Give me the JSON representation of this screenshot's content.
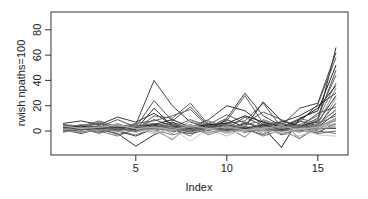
{
  "chart_data": {
    "type": "line",
    "title": "",
    "xlabel": "Index",
    "ylabel": "rwish npaths=100",
    "xlim": [
      0.3,
      16.7
    ],
    "ylim": [
      -18,
      95
    ],
    "xticks": [
      5,
      10,
      15
    ],
    "yticks": [
      0,
      20,
      40,
      60,
      80
    ],
    "grid": false,
    "legend": "none",
    "x": [
      1,
      2,
      3,
      4,
      5,
      6,
      7,
      8,
      9,
      10,
      11,
      12,
      13,
      14,
      15,
      16
    ],
    "series": [
      {
        "name": "path-1",
        "color": "#333333",
        "values": [
          3,
          2,
          1,
          -2,
          -12,
          -3,
          3,
          1,
          2,
          4,
          2,
          5,
          -3,
          2,
          8,
          66
        ]
      },
      {
        "name": "path-2",
        "color": "#444444",
        "values": [
          4,
          3,
          6,
          2,
          5,
          40,
          20,
          7,
          3,
          10,
          30,
          12,
          4,
          18,
          22,
          62
        ]
      },
      {
        "name": "path-3",
        "color": "#555555",
        "values": [
          2,
          5,
          3,
          9,
          3,
          24,
          8,
          19,
          4,
          6,
          8,
          22,
          3,
          7,
          21,
          58
        ]
      },
      {
        "name": "path-4",
        "color": "#222222",
        "values": [
          1,
          0,
          3,
          1,
          2,
          4,
          3,
          2,
          4,
          1,
          6,
          3,
          -13,
          10,
          16,
          52
        ]
      },
      {
        "name": "path-5",
        "color": "#666666",
        "values": [
          5,
          4,
          8,
          3,
          6,
          8,
          12,
          17,
          3,
          8,
          28,
          6,
          2,
          5,
          12,
          44
        ]
      },
      {
        "name": "path-6",
        "color": "#777777",
        "values": [
          0,
          2,
          -2,
          4,
          1,
          6,
          2,
          -4,
          8,
          3,
          -5,
          9,
          4,
          2,
          9,
          38
        ]
      },
      {
        "name": "path-7",
        "color": "#888888",
        "values": [
          3,
          1,
          2,
          0,
          -3,
          2,
          -7,
          5,
          0,
          6,
          2,
          1,
          8,
          -6,
          5,
          34
        ]
      },
      {
        "name": "path-8",
        "color": "#3a3a3a",
        "values": [
          6,
          8,
          5,
          11,
          7,
          14,
          5,
          3,
          9,
          20,
          16,
          5,
          7,
          12,
          20,
          30
        ]
      },
      {
        "name": "path-9",
        "color": "#999999",
        "values": [
          2,
          -1,
          4,
          2,
          0,
          5,
          -2,
          8,
          3,
          -1,
          4,
          -2,
          6,
          3,
          2,
          26
        ]
      },
      {
        "name": "path-10",
        "color": "#4a4a4a",
        "values": [
          1,
          3,
          0,
          5,
          2,
          9,
          4,
          1,
          6,
          2,
          11,
          4,
          1,
          8,
          4,
          22
        ]
      },
      {
        "name": "path-11",
        "color": "#5a5a5a",
        "values": [
          4,
          2,
          3,
          -3,
          1,
          12,
          10,
          22,
          5,
          13,
          6,
          15,
          9,
          3,
          14,
          19
        ]
      },
      {
        "name": "path-12",
        "color": "#aaaaaa",
        "values": [
          0,
          1,
          -1,
          2,
          3,
          -1,
          1,
          3,
          -2,
          5,
          0,
          3,
          2,
          -1,
          6,
          16
        ]
      },
      {
        "name": "path-13",
        "color": "#2a2a2a",
        "values": [
          2,
          0,
          1,
          3,
          0,
          4,
          7,
          2,
          1,
          9,
          3,
          23,
          8,
          4,
          3,
          14
        ]
      },
      {
        "name": "path-14",
        "color": "#6a6a6a",
        "values": [
          5,
          3,
          7,
          2,
          4,
          6,
          3,
          9,
          4,
          2,
          5,
          8,
          3,
          10,
          6,
          12
        ]
      },
      {
        "name": "path-15",
        "color": "#7a7a7a",
        "values": [
          -1,
          2,
          0,
          -4,
          2,
          1,
          -3,
          0,
          3,
          -2,
          2,
          -4,
          1,
          -6,
          3,
          10
        ]
      },
      {
        "name": "path-16",
        "color": "#8a8a8a",
        "values": [
          3,
          4,
          2,
          6,
          1,
          3,
          5,
          2,
          7,
          4,
          1,
          6,
          5,
          2,
          4,
          8
        ]
      },
      {
        "name": "path-17",
        "color": "#3f3f3f",
        "values": [
          1,
          -2,
          2,
          0,
          -4,
          2,
          0,
          -2,
          1,
          3,
          -1,
          2,
          0,
          1,
          -1,
          6
        ]
      },
      {
        "name": "path-18",
        "color": "#bbbbbb",
        "values": [
          2,
          1,
          3,
          1,
          2,
          0,
          -6,
          3,
          1,
          -4,
          2,
          0,
          -2,
          -4,
          1,
          4
        ]
      },
      {
        "name": "path-19",
        "color": "#4f4f4f",
        "values": [
          0,
          2,
          1,
          3,
          0,
          2,
          1,
          0,
          2,
          1,
          3,
          2,
          1,
          0,
          2,
          2
        ]
      },
      {
        "name": "path-20",
        "color": "#606060",
        "values": [
          4,
          1,
          -1,
          2,
          5,
          1,
          3,
          -1,
          4,
          0,
          2,
          -3,
          4,
          1,
          -2,
          0
        ]
      },
      {
        "name": "path-21",
        "color": "#707070",
        "values": [
          1,
          3,
          4,
          0,
          2,
          6,
          2,
          4,
          0,
          7,
          1,
          4,
          2,
          5,
          0,
          -2
        ]
      },
      {
        "name": "path-22",
        "color": "#cccccc",
        "values": [
          3,
          0,
          2,
          -1,
          1,
          -2,
          2,
          -8,
          2,
          -2,
          0,
          1,
          -1,
          2,
          -3,
          -4
        ]
      },
      {
        "name": "path-23",
        "color": "#1f1f1f",
        "values": [
          2,
          4,
          1,
          2,
          3,
          5,
          9,
          3,
          5,
          6,
          12,
          7,
          3,
          9,
          18,
          36
        ]
      },
      {
        "name": "path-24",
        "color": "#959595",
        "values": [
          0,
          -1,
          1,
          2,
          -1,
          3,
          0,
          2,
          -1,
          1,
          0,
          3,
          -2,
          1,
          3,
          5
        ]
      },
      {
        "name": "path-25",
        "color": "#505050",
        "values": [
          5,
          2,
          4,
          1,
          3,
          2,
          6,
          1,
          3,
          5,
          2,
          4,
          6,
          3,
          10,
          48
        ]
      },
      {
        "name": "path-26",
        "color": "#a0a0a0",
        "values": [
          1,
          2,
          0,
          4,
          2,
          1,
          3,
          5,
          1,
          2,
          4,
          1,
          3,
          -1,
          2,
          3
        ]
      },
      {
        "name": "path-27",
        "color": "#353535",
        "values": [
          3,
          1,
          2,
          3,
          1,
          18,
          4,
          2,
          3,
          1,
          2,
          5,
          1,
          4,
          7,
          28
        ]
      },
      {
        "name": "path-28",
        "color": "#858585",
        "values": [
          2,
          3,
          1,
          0,
          4,
          2,
          1,
          3,
          -3,
          2,
          1,
          0,
          2,
          4,
          1,
          9
        ]
      },
      {
        "name": "path-29",
        "color": "#656565",
        "values": [
          0,
          1,
          3,
          2,
          0,
          4,
          2,
          1,
          3,
          0,
          7,
          2,
          0,
          3,
          5,
          17
        ]
      },
      {
        "name": "path-30",
        "color": "#b0b0b0",
        "values": [
          4,
          2,
          3,
          5,
          2,
          3,
          1,
          4,
          2,
          3,
          1,
          2,
          4,
          1,
          3,
          6
        ]
      }
    ]
  }
}
